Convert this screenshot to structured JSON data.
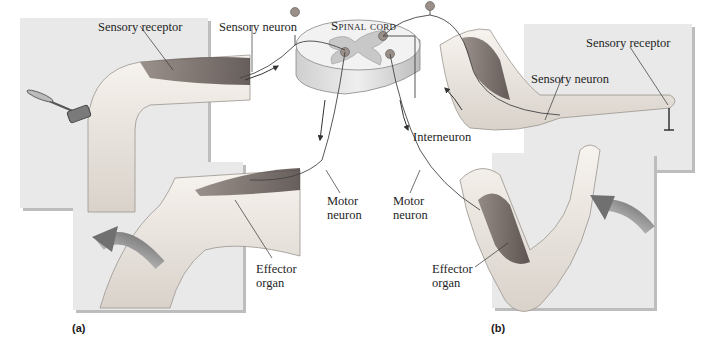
{
  "diagram": {
    "colors": {
      "panel_bg": "#e9e9e9",
      "panel_shadow": "#bdbdbd",
      "skin": "#f1ece6",
      "muscle": "#6e6460",
      "neuron_body": "#9b8f8a",
      "grey_matter": "#c8c8c8",
      "white_matter": "#f2f2f2",
      "arrow": "#8a8a8a"
    },
    "center": {
      "label": "Spinal cord"
    },
    "part_a": {
      "label": "(a)",
      "sensory_receptor": "Sensory receptor",
      "sensory_neuron": "Sensory neuron",
      "motor_neuron": "Motor neuron",
      "effector_organ": "Effector organ",
      "motor_neuron_lines": [
        "Motor",
        "neuron"
      ],
      "effector_organ_lines": [
        "Effector",
        "organ"
      ]
    },
    "part_b": {
      "label": "(b)",
      "sensory_receptor": "Sensory receptor",
      "sensory_neuron": "Sensory neuron",
      "interneuron": "Interneuron",
      "motor_neuron_lines": [
        "Motor",
        "neuron"
      ],
      "effector_organ_lines": [
        "Effector",
        "organ"
      ]
    }
  }
}
